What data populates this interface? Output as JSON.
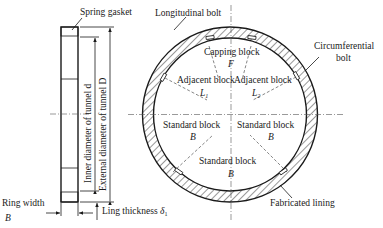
{
  "side_view": {
    "spring_gasket": "Spring gasket",
    "inner_diameter": "Inner diameter of tunnel d",
    "external_diameter": "External diameter of tunnel D",
    "ring_width": "Ring width",
    "ring_width_symbol": "B",
    "ling_thickness": "Ling thickness",
    "ling_thickness_symbol": "δ",
    "ling_thickness_sub": "1"
  },
  "ring_view": {
    "longitudinal_bolt": "Longitudinal bolt",
    "circumferential_bolt_line1": "Circumferential",
    "circumferential_bolt_line2": "bolt",
    "fabricated_lining": "Fabricated lining",
    "blocks": [
      {
        "label": "Capping block",
        "symbol": "F",
        "sub": ""
      },
      {
        "label": "Adjacent block",
        "symbol": "L",
        "sub": "1"
      },
      {
        "label": "Adjacent block",
        "symbol": "L",
        "sub": "2"
      },
      {
        "label": "Standard block",
        "symbol": "B",
        "sub": ""
      },
      {
        "label": "Standard block",
        "symbol": "B",
        "sub": ""
      },
      {
        "label": "Standard block",
        "symbol": "B",
        "sub": ""
      }
    ]
  }
}
